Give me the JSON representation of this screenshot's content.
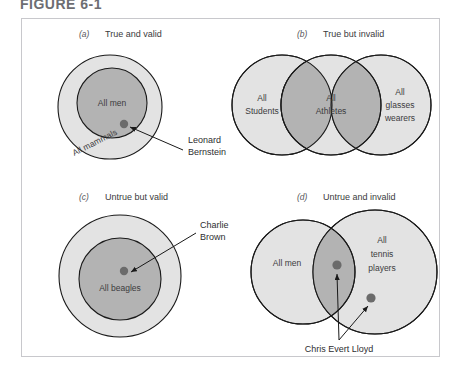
{
  "figure": {
    "title": "FIGURE 6-1",
    "frame_border_color": "#c8c8cc",
    "background": "#ffffff"
  },
  "colors": {
    "fill_light": "#e3e3e3",
    "fill_dark": "#b3b3b3",
    "stroke": "#1a1a1a",
    "dot": "#6b6b6b",
    "text": "#3b3b3d"
  },
  "panels": [
    {
      "id": "a",
      "letter": "(a)",
      "caption": "True and valid",
      "type": "nested-circles",
      "labels": {
        "outer": "All mammals",
        "inner": "All men"
      },
      "callout": {
        "line1": "Leonard",
        "line2": "Bernstein"
      }
    },
    {
      "id": "b",
      "letter": "(b)",
      "caption": "True but invalid",
      "type": "three-overlapping-circles",
      "labels": {
        "left_line1": "All",
        "left_line2": "Students",
        "middle_line1": "All",
        "middle_line2": "Athletes",
        "right_line1": "All",
        "right_line2": "glasses",
        "right_line3": "wearers"
      }
    },
    {
      "id": "c",
      "letter": "(c)",
      "caption": "Untrue but valid",
      "type": "nested-circles",
      "labels": {
        "inner": "All beagles"
      },
      "callout": {
        "line1": "Charlie",
        "line2": "Brown"
      }
    },
    {
      "id": "d",
      "letter": "(d)",
      "caption": "Untrue and invalid",
      "type": "two-overlapping-circles",
      "labels": {
        "left": "All men",
        "right_line1": "All",
        "right_line2": "tennis",
        "right_line3": "players"
      },
      "callout": {
        "line1": "Chris Evert Lloyd"
      }
    }
  ]
}
